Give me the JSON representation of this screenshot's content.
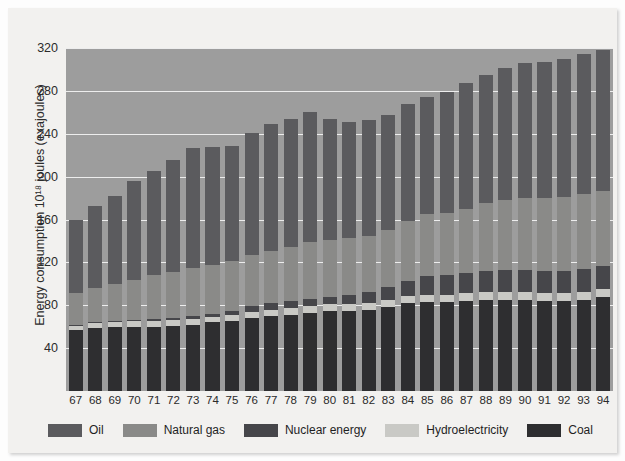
{
  "chart_data": {
    "type": "bar",
    "stacked": true,
    "title": "",
    "xlabel": "",
    "ylabel": "Energy consumption 10¹⁸ joules (exajoules)",
    "ylim": [
      0,
      320
    ],
    "yticks": [
      40,
      80,
      120,
      160,
      200,
      240,
      280,
      320
    ],
    "grid": true,
    "legend_position": "bottom",
    "categories": [
      "67",
      "68",
      "69",
      "70",
      "71",
      "72",
      "73",
      "74",
      "75",
      "76",
      "77",
      "78",
      "79",
      "80",
      "81",
      "82",
      "83",
      "84",
      "85",
      "86",
      "87",
      "88",
      "89",
      "90",
      "91",
      "92",
      "93",
      "94"
    ],
    "series": [
      {
        "name": "Coal",
        "color": "#2e2e30",
        "values": [
          57,
          59,
          60,
          60,
          60,
          61,
          62,
          64,
          65,
          68,
          70,
          71,
          73,
          75,
          75,
          76,
          78,
          82,
          83,
          83,
          84,
          85,
          85,
          85,
          84,
          84,
          85,
          88
        ]
      },
      {
        "name": "Hydroelectricity",
        "color": "#c9c9c5",
        "values": [
          4,
          4,
          4,
          5,
          5,
          5,
          5,
          5,
          6,
          6,
          6,
          6,
          6,
          6,
          6,
          6,
          7,
          7,
          7,
          7,
          7,
          7,
          7,
          7,
          7,
          7,
          7,
          7
        ]
      },
      {
        "name": "Nuclear energy",
        "color": "#46464a",
        "values": [
          1,
          1,
          1,
          1,
          2,
          2,
          3,
          3,
          4,
          5,
          6,
          7,
          7,
          7,
          9,
          10,
          12,
          14,
          17,
          18,
          19,
          20,
          21,
          21,
          21,
          21,
          22,
          22
        ]
      },
      {
        "name": "Natural gas",
        "color": "#8a8a88",
        "values": [
          29,
          32,
          35,
          38,
          41,
          43,
          45,
          46,
          46,
          48,
          49,
          50,
          53,
          53,
          53,
          53,
          53,
          56,
          58,
          58,
          60,
          63,
          65,
          67,
          68,
          69,
          70,
          70
        ]
      },
      {
        "name": "Oil",
        "color": "#5b5b5e",
        "values": [
          69,
          77,
          82,
          92,
          97,
          105,
          112,
          110,
          108,
          114,
          118,
          120,
          121,
          113,
          108,
          108,
          108,
          109,
          109,
          113,
          117,
          120,
          123,
          126,
          127,
          129,
          130,
          131
        ]
      }
    ]
  },
  "legend": {
    "items": [
      {
        "label": "Oil",
        "color": "#5b5b5e",
        "name": "legend-oil"
      },
      {
        "label": "Natural gas",
        "color": "#8a8a88",
        "name": "legend-natural-gas"
      },
      {
        "label": "Nuclear energy",
        "color": "#46464a",
        "name": "legend-nuclear-energy"
      },
      {
        "label": "Hydroelectricity",
        "color": "#c9c9c5",
        "name": "legend-hydroelectricity"
      },
      {
        "label": "Coal",
        "color": "#2e2e30",
        "name": "legend-coal"
      }
    ]
  }
}
